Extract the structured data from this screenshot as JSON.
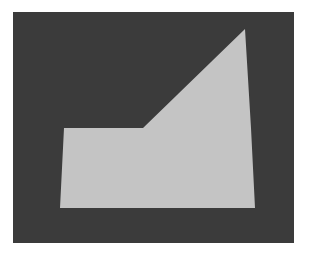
{
  "image": {
    "background_color": "#ffffff",
    "panel": {
      "x": 13,
      "y": 12,
      "width": 281,
      "height": 231,
      "color": "#3b3b3b"
    },
    "shape": {
      "color": "#c4c4c4",
      "points": "64,128 143,128 245,29 251,128 255,208 60,208"
    }
  }
}
